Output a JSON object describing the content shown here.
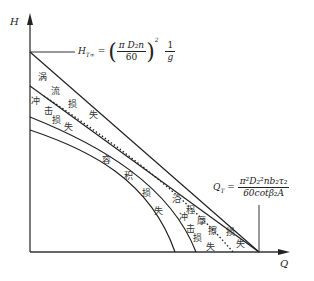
{
  "diagram": {
    "type": "pump head-flow loss diagram",
    "axes": {
      "y_label": "H",
      "x_label": "Q"
    },
    "formulas": {
      "head_theoretical": {
        "lhs": "H",
        "lhs_sub": "T∞",
        "eq": "=",
        "num": "π D₂n",
        "den": "60",
        "exp": "2",
        "tail_num": "1",
        "tail_den": "g"
      },
      "flow_theoretical": {
        "lhs": "Q",
        "lhs_sub": "T",
        "eq": "=",
        "num": "π²D₂²nb₂τ₂",
        "den": "60cotβ₂A"
      }
    },
    "region_labels": {
      "vortex_loss": [
        "涡",
        "流",
        "损",
        "失"
      ],
      "impact_loss_upper": [
        "冲",
        "击",
        "损",
        "失"
      ],
      "volumetric_loss": [
        "容",
        "积",
        "损",
        "失"
      ],
      "friction_loss": [
        "沿",
        "程",
        "摩",
        "擦",
        "损",
        "失"
      ],
      "impact_loss_lower": [
        "冲",
        "击",
        "损",
        "失"
      ]
    },
    "curves": [
      {
        "name": "theoretical-head-infinite-blades",
        "style": "solid",
        "shape": "straight"
      },
      {
        "name": "head-after-vortex-loss",
        "style": "solid",
        "shape": "straight"
      },
      {
        "name": "head-after-friction-loss",
        "style": "dotted",
        "shape": "curve"
      },
      {
        "name": "head-after-impact-loss",
        "style": "solid",
        "shape": "curve"
      },
      {
        "name": "actual-head-after-volumetric-loss",
        "style": "solid",
        "shape": "curve"
      }
    ],
    "colors": {
      "line": "#222222",
      "background": "#ffffff"
    }
  }
}
